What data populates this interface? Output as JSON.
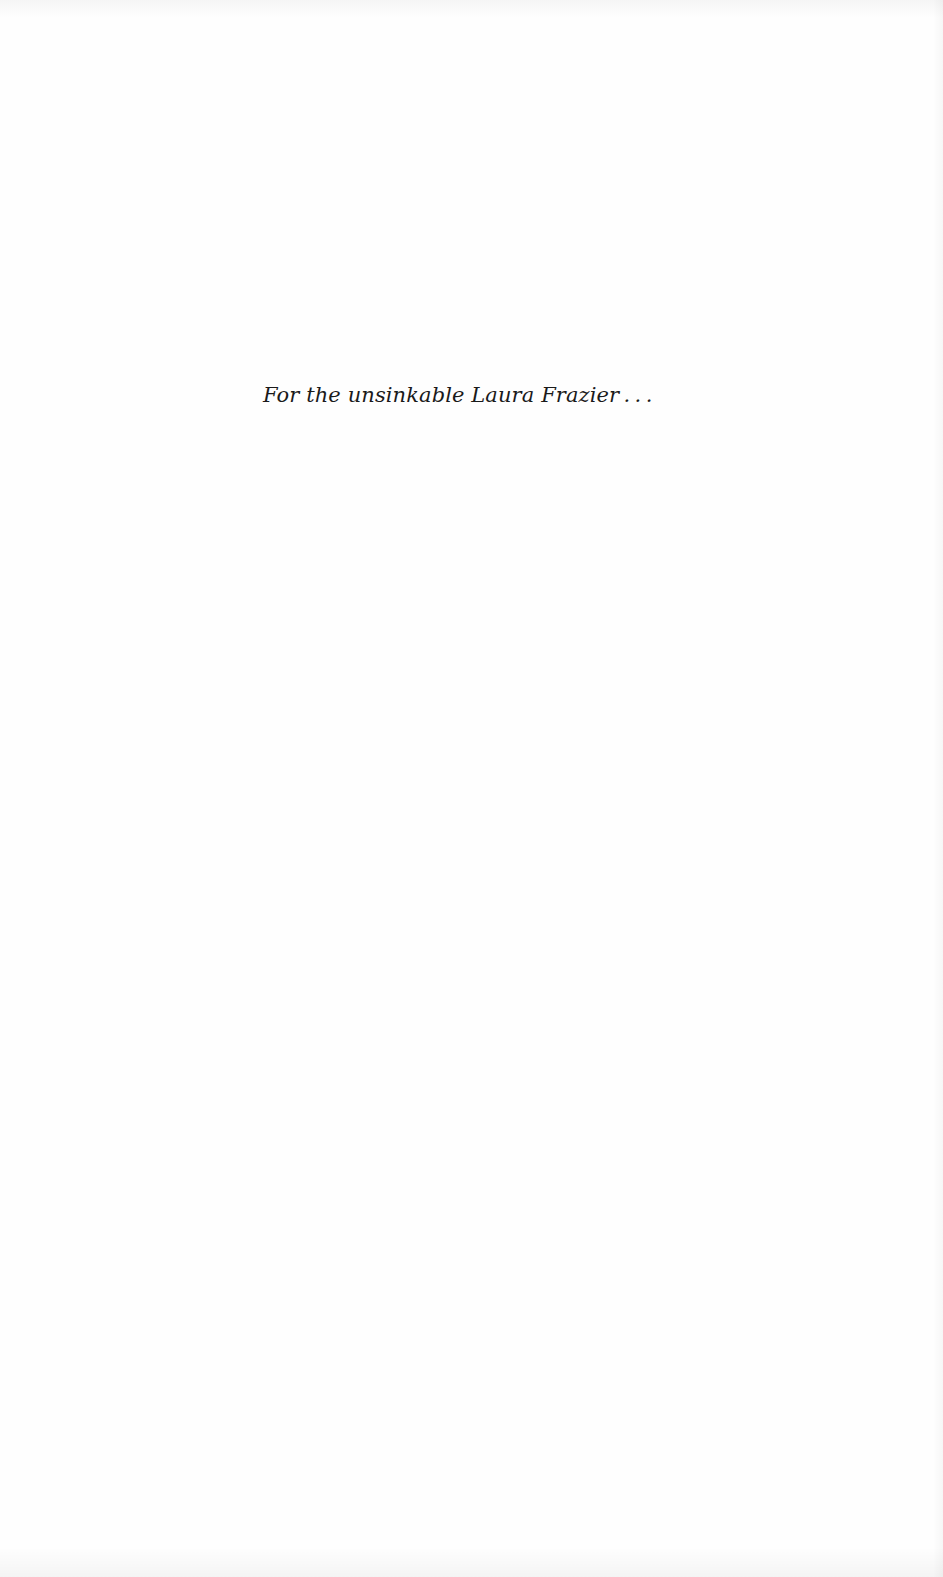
{
  "page": {
    "type": "dedication",
    "dedication_text": "For the unsinkable Laura Frazier . . ."
  }
}
